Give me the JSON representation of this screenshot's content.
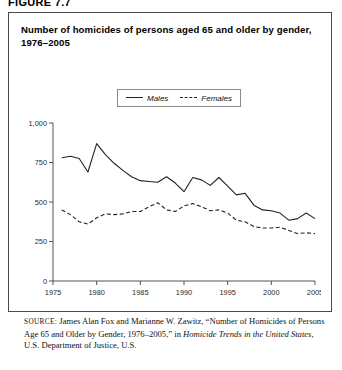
{
  "figure": {
    "label": "FIGURE 7.7"
  },
  "chart_title": "Number of homicides of persons aged 65 and older by gender, 1976–2005",
  "legend": {
    "entries": [
      {
        "label": "Males",
        "style": "solid",
        "swatch_icon": "solid-line-icon"
      },
      {
        "label": "Females",
        "style": "dashed",
        "swatch_icon": "dashed-line-icon"
      }
    ]
  },
  "source": {
    "prefix": "SOURCE:",
    "line1": " James Alan Fox and Marianne W. Zawitz, “Number of",
    "line2": "Homicides of Persons Age 65 and Older by Gender, 1976–2005,” in",
    "line3_italic": "Homicide Trends in the United States",
    "line3_rest": ", U.S. Department of Justice, U.S."
  },
  "chart_data": {
    "type": "line",
    "title": "Number of homicides of persons aged 65 and older by gender, 1976–2005",
    "xlabel": "",
    "ylabel": "",
    "xlim": [
      1975,
      2005
    ],
    "ylim": [
      0,
      1000
    ],
    "yticks": [
      0,
      250,
      500,
      750,
      1000
    ],
    "ytick_labels": [
      "0",
      "250",
      "500",
      "750",
      "1,000"
    ],
    "xticks": [
      1975,
      1980,
      1985,
      1990,
      1995,
      2000,
      2005
    ],
    "xtick_labels": [
      "1975",
      "1980",
      "1985",
      "1990",
      "1995",
      "2000",
      "2005"
    ],
    "grid": false,
    "legend_position": "top-center",
    "x": [
      1976,
      1977,
      1978,
      1979,
      1980,
      1981,
      1982,
      1983,
      1984,
      1985,
      1986,
      1987,
      1988,
      1989,
      1990,
      1991,
      1992,
      1993,
      1994,
      1995,
      1996,
      1997,
      1998,
      1999,
      2000,
      2001,
      2002,
      2003,
      2004,
      2005
    ],
    "series": [
      {
        "name": "Males",
        "style": "solid",
        "color": "#222222",
        "values": [
          780,
          790,
          775,
          690,
          870,
          800,
          745,
          700,
          660,
          635,
          630,
          625,
          660,
          620,
          565,
          655,
          640,
          605,
          655,
          600,
          545,
          555,
          480,
          450,
          445,
          430,
          385,
          395,
          430,
          395
        ]
      },
      {
        "name": "Females",
        "style": "dashed",
        "color": "#222222",
        "values": [
          450,
          420,
          375,
          360,
          400,
          425,
          420,
          425,
          440,
          440,
          470,
          495,
          450,
          440,
          475,
          490,
          470,
          445,
          450,
          430,
          385,
          375,
          345,
          335,
          335,
          340,
          320,
          300,
          305,
          300
        ]
      }
    ]
  }
}
